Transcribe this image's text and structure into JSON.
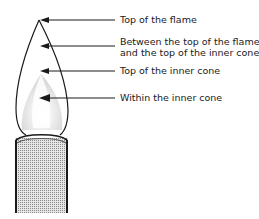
{
  "diagram": {
    "type": "labeled-illustration",
    "labels": [
      {
        "id": "top-of-flame",
        "lines": [
          "Top of the flame"
        ]
      },
      {
        "id": "between",
        "lines": [
          "Between the top of the flame",
          "and the top of the inner cone"
        ]
      },
      {
        "id": "top-inner-cone",
        "lines": [
          "Top of the inner cone"
        ]
      },
      {
        "id": "within-inner-cone",
        "lines": [
          "Within the inner cone"
        ]
      }
    ],
    "colors": {
      "line": "#1a1a1a",
      "inner_cone": "#d8d8d8",
      "tube_fill": "#bdbdbd",
      "background": "#ffffff"
    }
  }
}
